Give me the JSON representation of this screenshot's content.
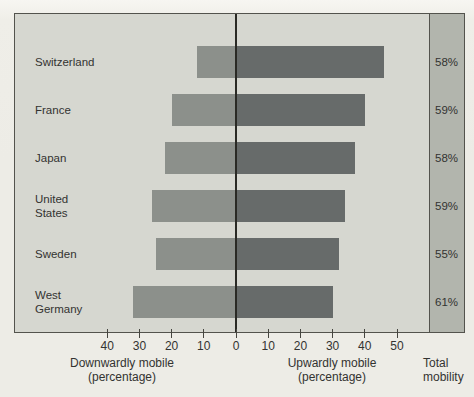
{
  "chart_data": {
    "type": "bar",
    "variant": "diverging-horizontal",
    "title": "",
    "categories": [
      "Switzerland",
      "France",
      "Japan",
      "United States",
      "Sweden",
      "West Germany"
    ],
    "categories_display": [
      "Switzerland",
      "France",
      "Japan",
      "United\nStates",
      "Sweden",
      "West\nGermany"
    ],
    "series": [
      {
        "name": "Downwardly mobile (percentage)",
        "side": "left",
        "values": [
          12,
          20,
          22,
          26,
          25,
          32
        ]
      },
      {
        "name": "Upwardly mobile (percentage)",
        "side": "right",
        "values": [
          46,
          40,
          37,
          34,
          32,
          30
        ]
      }
    ],
    "totals": {
      "header_line1": "Total",
      "header_line2": "mobility",
      "values": [
        "58%",
        "59%",
        "58%",
        "59%",
        "55%",
        "61%"
      ]
    },
    "x_ticks": [
      {
        "v": -40,
        "label": "40"
      },
      {
        "v": -30,
        "label": "30"
      },
      {
        "v": -20,
        "label": "20"
      },
      {
        "v": -10,
        "label": "10"
      },
      {
        "v": 0,
        "label": "0"
      },
      {
        "v": 10,
        "label": "10"
      },
      {
        "v": 20,
        "label": "20"
      },
      {
        "v": 30,
        "label": "30"
      },
      {
        "v": 40,
        "label": "40"
      },
      {
        "v": 50,
        "label": "50"
      }
    ],
    "axis_captions": {
      "down_line1": "Downwardly mobile",
      "down_line2": "(percentage)",
      "up_line1": "Upwardly mobile",
      "up_line2": "(percentage)"
    },
    "xlim": [
      -68,
      60
    ],
    "grid": false,
    "legend": "none"
  },
  "colors": {
    "page_bg": "#edece6",
    "plot_bg": "#d6d7d0",
    "strip_bg": "#b2b5ad",
    "down_bar": "#8c908b",
    "up_bar": "#676b6a",
    "frame_border": "#53534d",
    "zero_line": "#2a2a25",
    "tick": "#45453f",
    "text": "#333331"
  }
}
